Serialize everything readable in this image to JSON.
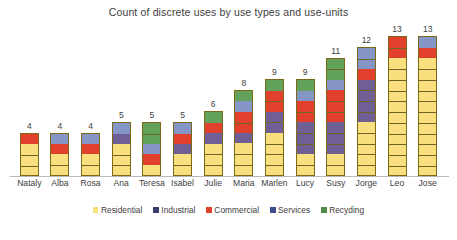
{
  "chart_data": {
    "type": "bar",
    "subtype": "stacked-column",
    "title": "Count of discrete uses by use types and use-units",
    "xlabel": "",
    "ylabel": "",
    "ylim": [
      0,
      13
    ],
    "grid": false,
    "legend_position": "bottom",
    "data_labels": true,
    "categories": [
      "Nataly",
      "Alba",
      "Rosa",
      "Ana",
      "Teresa",
      "Isabel",
      "Julie",
      "Maria",
      "Marlen",
      "Lucy",
      "Susy",
      "Jorge",
      "Leo",
      "Jose"
    ],
    "totals": [
      4,
      4,
      4,
      5,
      5,
      5,
      6,
      8,
      9,
      9,
      11,
      12,
      13,
      13
    ],
    "series": [
      {
        "name": "Residential",
        "color": "#FADF7F",
        "values": [
          3,
          2,
          2,
          3,
          1,
          2,
          3,
          3,
          4,
          2,
          2,
          5,
          11,
          11
        ]
      },
      {
        "name": "Industrial",
        "color": "#6F5F95",
        "values": [
          0,
          0,
          0,
          1,
          0,
          1,
          1,
          1,
          2,
          3,
          3,
          4,
          0,
          0
        ]
      },
      {
        "name": "Commercial",
        "color": "#E0402C",
        "values": [
          1,
          1,
          1,
          0,
          1,
          1,
          1,
          2,
          2,
          2,
          3,
          1,
          2,
          1
        ]
      },
      {
        "name": "Services",
        "color": "#8495C6",
        "values": [
          0,
          1,
          1,
          1,
          1,
          1,
          0,
          1,
          0,
          1,
          1,
          2,
          0,
          1
        ]
      },
      {
        "name": "Recyding",
        "color": "#63A25B",
        "values": [
          0,
          0,
          0,
          0,
          2,
          0,
          1,
          1,
          1,
          1,
          2,
          0,
          0,
          0
        ]
      }
    ]
  },
  "legend": {
    "items": [
      {
        "label": "Residential",
        "color": "#FADF7F"
      },
      {
        "label": "Industrial",
        "color": "#3B3B6B"
      },
      {
        "label": "Commercial",
        "color": "#E0402C"
      },
      {
        "label": "Services",
        "color": "#3C4C8C"
      },
      {
        "label": "Recyding",
        "color": "#4E8A4A"
      }
    ]
  }
}
